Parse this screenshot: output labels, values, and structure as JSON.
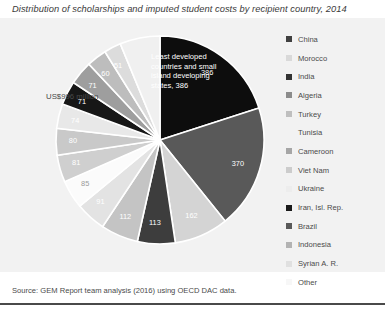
{
  "title": "Distribution of scholarships and imputed student costs by recipient country, 2014",
  "source": "Source: GEM Report team analysis (2016) using OECD DAC data.",
  "callout": "US$996 million",
  "ldc_note": "Least developed countries and small island developing states, 386",
  "panel_bg": "#f2f2f2",
  "legend": {
    "items": [
      {
        "label": "China",
        "color": "#404040"
      },
      {
        "label": "Morocco",
        "color": "#d9d9d9"
      },
      {
        "label": "India",
        "color": "#333333"
      },
      {
        "label": "Algeria",
        "color": "#8c8c8c"
      },
      {
        "label": "Turkey",
        "color": "#bfbfbf"
      },
      {
        "label": "Tunisia",
        "color": "#f2f2f2"
      },
      {
        "label": "Cameroon",
        "color": "#a6a6a6"
      },
      {
        "label": "Viet Nam",
        "color": "#cccccc"
      },
      {
        "label": "Ukraine",
        "color": "#ededed"
      },
      {
        "label": "Iran, Isl. Rep.",
        "color": "#1a1a1a"
      },
      {
        "label": "Brazil",
        "color": "#595959"
      },
      {
        "label": "Indonesia",
        "color": "#b3b3b3"
      },
      {
        "label": "Syrian A. R.",
        "color": "#e0e0e0"
      },
      {
        "label": "Other",
        "color": "#f7f7f7"
      }
    ]
  },
  "chart_data": {
    "type": "pie",
    "title": "Distribution of scholarships and imputed student costs by recipient country, 2014",
    "unit": "US$ million",
    "total": 996,
    "legend_position": "right",
    "start_angle_deg": -90,
    "labels": [
      "Least developed countries and small island developing states",
      "China",
      "Morocco",
      "India",
      "Algeria",
      "Turkey",
      "Tunisia",
      "Cameroon",
      "Viet Nam",
      "Ukraine",
      "Iran, Isl. Rep.",
      "Brazil",
      "Indonesia",
      "Syrian A. R.",
      "Other"
    ],
    "values": [
      386,
      370,
      162,
      113,
      112,
      91,
      85,
      81,
      80,
      74,
      71,
      71,
      60,
      51,
      120
    ],
    "slices": [
      {
        "name": "Least developed countries and small island developing states",
        "value": 386,
        "color": "#0d0d0d",
        "label": "386",
        "label_color": "#ffffff"
      },
      {
        "name": "China",
        "value": 370,
        "color": "#595959",
        "label": "370",
        "label_color": "#ffffff"
      },
      {
        "name": "Morocco",
        "value": 162,
        "color": "#d4d4d4",
        "label": "162",
        "label_color": "#ffffff"
      },
      {
        "name": "India",
        "value": 113,
        "color": "#3d3d3d",
        "label": "113",
        "label_color": "#ffffff"
      },
      {
        "name": "Algeria",
        "value": 112,
        "color": "#c4c4c4",
        "label": "112",
        "label_color": "#ffffff"
      },
      {
        "name": "Turkey",
        "value": 91,
        "color": "#e3e3e3",
        "label": "91",
        "label_color": "#ffffff"
      },
      {
        "name": "Tunisia",
        "value": 85,
        "color": "#fbfbfb",
        "label": "85",
        "label_color": "#9a9a9a"
      },
      {
        "name": "Cameroon",
        "value": 81,
        "color": "#cfcfcf",
        "label": "81",
        "label_color": "#ffffff"
      },
      {
        "name": "Viet Nam",
        "value": 80,
        "color": "#c9c9c9",
        "label": "80",
        "label_color": "#ffffff"
      },
      {
        "name": "Ukraine",
        "value": 74,
        "color": "#e8e8e8",
        "label": "74",
        "label_color": "#ffffff"
      },
      {
        "name": "Iran, Isl. Rep.",
        "value": 71,
        "color": "#171717",
        "label": "71",
        "label_color": "#ffffff"
      },
      {
        "name": "Brazil",
        "value": 71,
        "color": "#9e9e9e",
        "label": "71",
        "label_color": "#ffffff"
      },
      {
        "name": "Indonesia",
        "value": 60,
        "color": "#bdbdbd",
        "label": "60",
        "label_color": "#ffffff"
      },
      {
        "name": "Syrian A. R.",
        "value": 51,
        "color": "#dcdcdc",
        "label": "51",
        "label_color": "#ffffff"
      },
      {
        "name": "Other",
        "value": 120,
        "color": "#f0f0f0",
        "label": "",
        "label_color": "#9a9a9a"
      }
    ]
  }
}
